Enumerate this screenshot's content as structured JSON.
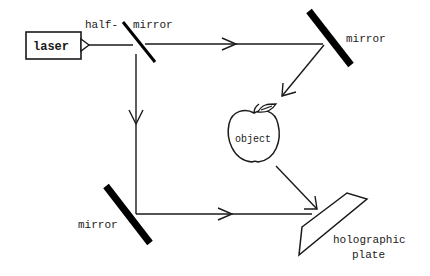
{
  "diagram": {
    "components": {
      "laser": {
        "label": "laser"
      },
      "half_mirror": {
        "label_left": "half-",
        "label_right": "mirror"
      },
      "top_mirror": {
        "label": "mirror"
      },
      "bottom_mirror": {
        "label": "mirror"
      },
      "object": {
        "label": "object",
        "icon": "apple-icon"
      },
      "plate": {
        "label_line1": "holographic",
        "label_line2": "plate"
      }
    },
    "beams": [
      {
        "from": "laser",
        "to": "half_mirror"
      },
      {
        "from": "half_mirror",
        "to": "top_mirror"
      },
      {
        "from": "top_mirror",
        "to": "object"
      },
      {
        "from": "object",
        "to": "plate"
      },
      {
        "from": "half_mirror",
        "to": "bottom_mirror"
      },
      {
        "from": "bottom_mirror",
        "to": "plate"
      }
    ],
    "colors": {
      "ink": "#1a1a1a",
      "background": "#ffffff"
    }
  }
}
